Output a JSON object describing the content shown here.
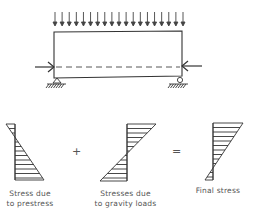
{
  "diagram": {
    "beam": {
      "load": "uniform distributed gravity load",
      "load_arrow_count": 19,
      "prestress_force": "axial compression along dashed tendon line",
      "supports": [
        "pin",
        "roller"
      ]
    },
    "stress_diagrams": [
      {
        "id": "prestress",
        "label_line1": "Stress due",
        "label_line2": "to prestress"
      },
      {
        "id": "gravity",
        "label_line1": "Stresses due",
        "label_line2": "to gravity loads"
      },
      {
        "id": "final",
        "label_line1": "Final stress",
        "label_line2": ""
      }
    ],
    "operators": {
      "plus": "+",
      "equals": "="
    },
    "colors": {
      "ink": "#333333",
      "text": "#555555",
      "background": "#ffffff"
    }
  }
}
